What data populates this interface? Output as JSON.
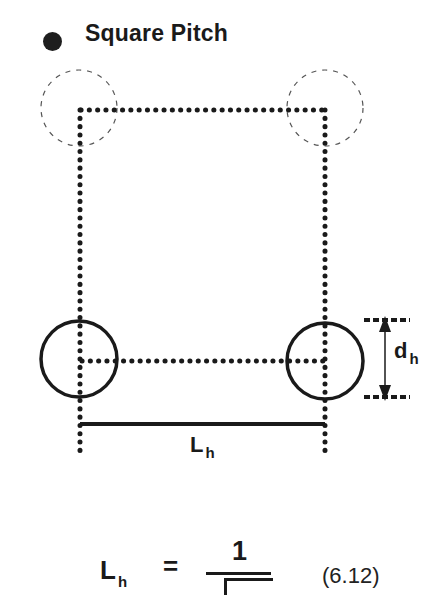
{
  "header": {
    "title": "Square Pitch",
    "bullet_icon": "filled-circle-bullet"
  },
  "diagram": {
    "type": "square-pitch-hole-layout",
    "hole_diameter_label": {
      "main": "d",
      "sub": "h"
    },
    "pitch_label": {
      "main": "L",
      "sub": "h"
    },
    "holes": [
      {
        "position": "top-left",
        "style": "dashed",
        "cx": 79,
        "cy": 108,
        "r": 38
      },
      {
        "position": "top-right",
        "style": "dashed",
        "cx": 325,
        "cy": 108,
        "r": 38
      },
      {
        "position": "bottom-left",
        "style": "solid",
        "cx": 79,
        "cy": 359,
        "r": 38
      },
      {
        "position": "bottom-right",
        "style": "solid",
        "cx": 325,
        "cy": 360,
        "r": 38
      }
    ],
    "colors": {
      "stroke": "#1a1a1a",
      "dashed": "#555555"
    }
  },
  "equation": {
    "lhs_main": "L",
    "lhs_sub": "h",
    "equals": "=",
    "numerator": "1",
    "reference": "(6.12)"
  }
}
